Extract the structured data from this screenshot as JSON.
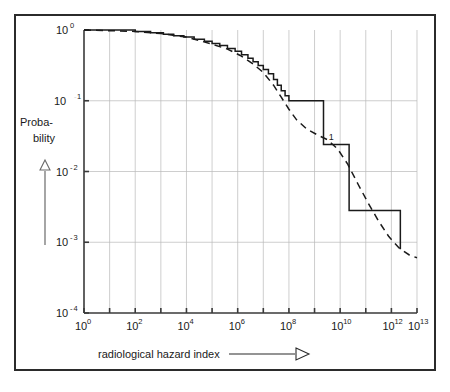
{
  "figure": {
    "background_color": "#ffffff",
    "border_color": "#2b2b2b",
    "plot_line_color": "#1a1a1a",
    "grid_color": "#b9b9b9"
  },
  "axes": {
    "x_title": "radiological hazard index",
    "x_arrow_icon": "right-arrow-outline",
    "y_title_line1": "Proba-",
    "y_title_line2": "bility",
    "y_arrow_icon": "up-triangle-outline"
  },
  "x_ticks": [
    {
      "base": "10",
      "exp": "0",
      "value": 0
    },
    {
      "base": "10",
      "exp": "2",
      "value": 2
    },
    {
      "base": "10",
      "exp": "4",
      "value": 4
    },
    {
      "base": "10",
      "exp": "6",
      "value": 6
    },
    {
      "base": "10",
      "exp": "8",
      "value": 8
    },
    {
      "base": "10",
      "exp": "10",
      "value": 10
    },
    {
      "base": "10",
      "exp": "12",
      "value": 12
    },
    {
      "base": "10",
      "exp": "13",
      "value": 13
    }
  ],
  "y_ticks": [
    {
      "base": "10",
      "exp": "0",
      "value": 0
    },
    {
      "base": "10",
      "exp": "-1",
      "value": -1
    },
    {
      "base": "10",
      "exp": "-2",
      "value": -2
    },
    {
      "base": "10",
      "exp": "-3",
      "value": -3
    },
    {
      "base": "10",
      "exp": "-4",
      "value": -4
    }
  ],
  "annotations": [
    {
      "label": "1",
      "x_log": 9.55,
      "y_log": -1.55
    }
  ],
  "chart_data": {
    "type": "line",
    "title": "",
    "subtitle": "",
    "xlabel": "radiological hazard index",
    "ylabel": "Probability",
    "xscale": "log",
    "yscale": "log",
    "xlim_log": [
      0,
      13
    ],
    "ylim_log": [
      -4,
      0
    ],
    "grid": true,
    "legend": "none",
    "series": [
      {
        "name": "empirical step (exceedance) curve",
        "style": "solid-step",
        "x_log": [
          0.0,
          1.0,
          2.0,
          2.6,
          3.1,
          3.5,
          3.9,
          4.3,
          4.7,
          5.0,
          5.3,
          5.6,
          5.9,
          6.15,
          6.4,
          6.6,
          6.8,
          7.0,
          7.2,
          7.4,
          7.55,
          7.7,
          7.85,
          8.0,
          8.3,
          9.35,
          9.35,
          10.1,
          10.35,
          10.35,
          11.9,
          12.35,
          12.35
        ],
        "y_log": [
          0.0,
          0.0,
          -0.02,
          -0.04,
          -0.06,
          -0.08,
          -0.1,
          -0.13,
          -0.16,
          -0.19,
          -0.22,
          -0.26,
          -0.3,
          -0.35,
          -0.4,
          -0.45,
          -0.5,
          -0.56,
          -0.62,
          -0.7,
          -0.78,
          -0.86,
          -0.93,
          -1.0,
          -1.0,
          -1.0,
          -1.62,
          -1.62,
          -1.62,
          -2.55,
          -2.55,
          -2.55,
          -3.1
        ]
      },
      {
        "name": "fitted smooth curve",
        "style": "dashed",
        "x_log": [
          0.0,
          1.0,
          2.0,
          3.0,
          4.0,
          5.0,
          5.6,
          6.1,
          6.6,
          7.0,
          7.4,
          7.7,
          8.0,
          8.3,
          8.7,
          9.1,
          9.5,
          9.9,
          10.3,
          10.7,
          11.1,
          11.5,
          11.9,
          12.3,
          12.7,
          13.0
        ],
        "y_log": [
          0.0,
          -0.01,
          -0.02,
          -0.05,
          -0.1,
          -0.2,
          -0.27,
          -0.36,
          -0.48,
          -0.6,
          -0.78,
          -0.95,
          -1.12,
          -1.27,
          -1.4,
          -1.48,
          -1.55,
          -1.68,
          -1.9,
          -2.18,
          -2.45,
          -2.7,
          -2.92,
          -3.08,
          -3.18,
          -3.22
        ]
      }
    ]
  }
}
